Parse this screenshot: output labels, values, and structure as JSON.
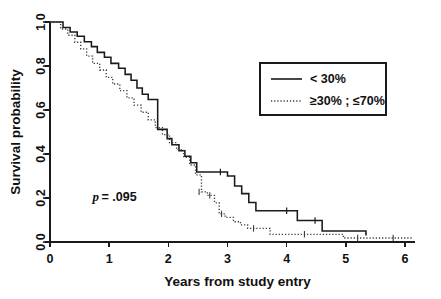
{
  "chart_data": {
    "type": "line",
    "subtype": "kaplan-meier-step",
    "title": "",
    "xlabel": "Years from study entry",
    "ylabel": "Survival probability",
    "xlim": [
      0,
      6.45
    ],
    "ylim": [
      0,
      1.0
    ],
    "xticks": [
      0,
      1,
      2,
      3,
      4,
      5,
      6
    ],
    "xtick_labels": [
      "0",
      "1",
      "2",
      "3",
      "4",
      "5",
      "6"
    ],
    "yticks": [
      0.0,
      0.2,
      0.4,
      0.6,
      0.8,
      1.0
    ],
    "ytick_labels": [
      "0.0",
      "0.2",
      "0.4",
      "0.6",
      "0.8",
      "1.0"
    ],
    "grid": false,
    "legend_position": "upper-right",
    "annotation": {
      "p_symbol": "p",
      "p_text": " = .095",
      "full_text": "p = .095",
      "x": 0.72,
      "y": 0.185
    },
    "series": [
      {
        "name": "< 30%",
        "style": "solid",
        "color": "#1a1a1a",
        "points": [
          [
            0.0,
            1.0
          ],
          [
            0.22,
            1.0
          ],
          [
            0.22,
            0.975
          ],
          [
            0.34,
            0.975
          ],
          [
            0.34,
            0.955
          ],
          [
            0.46,
            0.955
          ],
          [
            0.46,
            0.935
          ],
          [
            0.58,
            0.935
          ],
          [
            0.58,
            0.91
          ],
          [
            0.7,
            0.91
          ],
          [
            0.7,
            0.888
          ],
          [
            0.8,
            0.888
          ],
          [
            0.8,
            0.862
          ],
          [
            0.92,
            0.862
          ],
          [
            0.92,
            0.84
          ],
          [
            1.03,
            0.84
          ],
          [
            1.03,
            0.812
          ],
          [
            1.16,
            0.812
          ],
          [
            1.16,
            0.79
          ],
          [
            1.27,
            0.79
          ],
          [
            1.27,
            0.762
          ],
          [
            1.37,
            0.762
          ],
          [
            1.37,
            0.735
          ],
          [
            1.47,
            0.735
          ],
          [
            1.47,
            0.7
          ],
          [
            1.56,
            0.7
          ],
          [
            1.56,
            0.672
          ],
          [
            1.66,
            0.672
          ],
          [
            1.66,
            0.648
          ],
          [
            1.82,
            0.648
          ],
          [
            1.82,
            0.512
          ],
          [
            1.98,
            0.512
          ],
          [
            1.98,
            0.47
          ],
          [
            2.06,
            0.47
          ],
          [
            2.06,
            0.442
          ],
          [
            2.18,
            0.442
          ],
          [
            2.18,
            0.415
          ],
          [
            2.28,
            0.415
          ],
          [
            2.28,
            0.39
          ],
          [
            2.38,
            0.39
          ],
          [
            2.38,
            0.36
          ],
          [
            2.48,
            0.36
          ],
          [
            2.48,
            0.318
          ],
          [
            3.0,
            0.318
          ],
          [
            3.0,
            0.3
          ],
          [
            3.12,
            0.3
          ],
          [
            3.12,
            0.255
          ],
          [
            3.24,
            0.255
          ],
          [
            3.24,
            0.22
          ],
          [
            3.36,
            0.22
          ],
          [
            3.36,
            0.18
          ],
          [
            3.48,
            0.18
          ],
          [
            3.48,
            0.142
          ],
          [
            4.18,
            0.142
          ],
          [
            4.18,
            0.098
          ],
          [
            4.6,
            0.098
          ],
          [
            4.6,
            0.05
          ],
          [
            5.34,
            0.05
          ],
          [
            5.34,
            0.03
          ]
        ],
        "censor_points": [
          [
            2.88,
            0.318
          ],
          [
            4.0,
            0.142
          ],
          [
            4.48,
            0.098
          ]
        ]
      },
      {
        "name": "≥30% ; ≤70%",
        "style": "dotted",
        "color": "#3b3b3b",
        "points": [
          [
            0.0,
            1.0
          ],
          [
            0.18,
            1.0
          ],
          [
            0.18,
            0.968
          ],
          [
            0.3,
            0.968
          ],
          [
            0.3,
            0.94
          ],
          [
            0.42,
            0.94
          ],
          [
            0.42,
            0.908
          ],
          [
            0.52,
            0.908
          ],
          [
            0.52,
            0.878
          ],
          [
            0.62,
            0.878
          ],
          [
            0.62,
            0.845
          ],
          [
            0.72,
            0.845
          ],
          [
            0.72,
            0.812
          ],
          [
            0.84,
            0.812
          ],
          [
            0.84,
            0.782
          ],
          [
            0.95,
            0.782
          ],
          [
            0.95,
            0.748
          ],
          [
            1.06,
            0.748
          ],
          [
            1.06,
            0.718
          ],
          [
            1.18,
            0.718
          ],
          [
            1.18,
            0.688
          ],
          [
            1.3,
            0.688
          ],
          [
            1.3,
            0.655
          ],
          [
            1.42,
            0.655
          ],
          [
            1.42,
            0.622
          ],
          [
            1.54,
            0.622
          ],
          [
            1.54,
            0.59
          ],
          [
            1.66,
            0.59
          ],
          [
            1.66,
            0.555
          ],
          [
            1.78,
            0.555
          ],
          [
            1.78,
            0.52
          ],
          [
            1.9,
            0.52
          ],
          [
            1.9,
            0.488
          ],
          [
            2.02,
            0.488
          ],
          [
            2.02,
            0.452
          ],
          [
            2.14,
            0.452
          ],
          [
            2.14,
            0.42
          ],
          [
            2.26,
            0.42
          ],
          [
            2.26,
            0.385
          ],
          [
            2.36,
            0.385
          ],
          [
            2.36,
            0.35
          ],
          [
            2.46,
            0.35
          ],
          [
            2.46,
            0.305
          ],
          [
            2.56,
            0.305
          ],
          [
            2.56,
            0.228
          ],
          [
            2.66,
            0.228
          ],
          [
            2.66,
            0.212
          ],
          [
            2.78,
            0.212
          ],
          [
            2.78,
            0.178
          ],
          [
            2.86,
            0.178
          ],
          [
            2.86,
            0.128
          ],
          [
            2.96,
            0.128
          ],
          [
            2.96,
            0.112
          ],
          [
            3.1,
            0.112
          ],
          [
            3.1,
            0.092
          ],
          [
            3.22,
            0.092
          ],
          [
            3.22,
            0.078
          ],
          [
            3.34,
            0.078
          ],
          [
            3.34,
            0.062
          ],
          [
            3.72,
            0.062
          ],
          [
            3.72,
            0.035
          ],
          [
            4.96,
            0.035
          ],
          [
            4.96,
            0.018
          ],
          [
            6.12,
            0.018
          ]
        ],
        "censor_points": [
          [
            2.52,
            0.228
          ],
          [
            2.7,
            0.212
          ],
          [
            2.9,
            0.128
          ],
          [
            3.44,
            0.062
          ],
          [
            4.3,
            0.035
          ],
          [
            5.2,
            0.018
          ],
          [
            5.8,
            0.018
          ]
        ]
      }
    ],
    "legend": [
      {
        "label": "< 30%",
        "style": "solid"
      },
      {
        "label": "≥30% ; ≤70%",
        "style": "dotted"
      }
    ]
  },
  "figure": {
    "background_color": "#ffffff",
    "axis_color": "#1a1a1a",
    "plot_left_px": 50,
    "plot_right_px": 415,
    "plot_top_px": 22,
    "plot_bottom_px": 242
  }
}
